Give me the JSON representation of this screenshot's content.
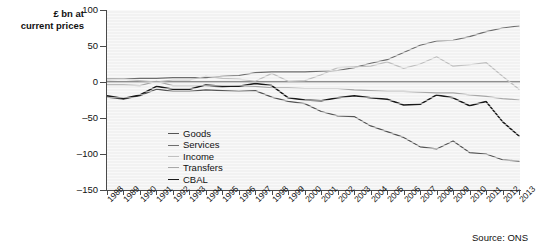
{
  "axis_title": "£ bn at\ncurrent prices",
  "source_note": "Source: ONS",
  "legend": {
    "items": [
      {
        "label": "Goods",
        "color": "#555555"
      },
      {
        "label": "Services",
        "color": "#6e6e6e"
      },
      {
        "label": "Income",
        "color": "#c0c0c0"
      },
      {
        "label": "Transfers",
        "color": "#a8a8a8"
      },
      {
        "label": "CBAL",
        "color": "#1a1a1a"
      }
    ]
  },
  "chart_data": {
    "type": "line",
    "title": "",
    "subtitle": "",
    "xlabel": "",
    "ylabel": "£ bn at current prices",
    "ylim": [
      -150,
      100
    ],
    "yticks": [
      100,
      50,
      0,
      -50,
      -100,
      -150
    ],
    "ytick_labels": [
      "100",
      "50",
      "0",
      "–50",
      "–100",
      "–150"
    ],
    "grid": false,
    "legend_position": "inside-lower-left",
    "source": "Source: ONS",
    "categories": [
      "1988",
      "1989",
      "1990",
      "1991",
      "1992",
      "1993",
      "1994",
      "1995",
      "1996",
      "1997",
      "1998",
      "1999",
      "2000",
      "2001",
      "2002",
      "2003",
      "2004",
      "2005",
      "2006",
      "2007",
      "2008",
      "2009",
      "2010",
      "2011",
      "2012",
      "2013"
    ],
    "series": [
      {
        "name": "Goods",
        "color": "#555555",
        "values": [
          -21,
          -24,
          -19,
          -10,
          -13,
          -13,
          -11,
          -12,
          -13,
          -12,
          -21,
          -27,
          -30,
          -41,
          -47,
          -48,
          -61,
          -69,
          -77,
          -90,
          -93,
          -82,
          -98,
          -100,
          -108,
          -110
        ]
      },
      {
        "name": "Services",
        "color": "#6e6e6e",
        "values": [
          4,
          4,
          5,
          5,
          6,
          6,
          6,
          8,
          9,
          13,
          14,
          14,
          14,
          15,
          16,
          20,
          26,
          31,
          41,
          51,
          57,
          58,
          63,
          70,
          75,
          78
        ]
      },
      {
        "name": "Income",
        "color": "#c0c0c0",
        "values": [
          3,
          4,
          2,
          0,
          3,
          3,
          8,
          5,
          4,
          1,
          12,
          1,
          2,
          10,
          20,
          21,
          22,
          28,
          19,
          25,
          35,
          22,
          24,
          27,
          8,
          -10
        ]
      },
      {
        "name": "Transfers",
        "color": "#a8a8a8",
        "values": [
          -4,
          -4,
          -5,
          1,
          -5,
          -5,
          -5,
          -7,
          -5,
          -6,
          -8,
          -8,
          -9,
          -9,
          -9,
          -11,
          -12,
          -13,
          -13,
          -14,
          -15,
          -15,
          -18,
          -20,
          -23,
          -25
        ]
      },
      {
        "name": "CBAL",
        "color": "#1a1a1a",
        "values": [
          -19,
          -23,
          -18,
          -6,
          -10,
          -10,
          -4,
          -6,
          -6,
          -2,
          -5,
          -22,
          -25,
          -26,
          -22,
          -19,
          -22,
          -24,
          -32,
          -31,
          -18,
          -22,
          -33,
          -27,
          -55,
          -75
        ]
      }
    ]
  }
}
